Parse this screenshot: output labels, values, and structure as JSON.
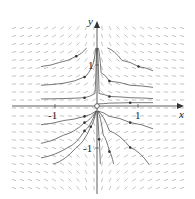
{
  "chart_data": {
    "type": "line",
    "title": "",
    "subtitle": "Direction field with solution curves (phase portrait)",
    "xlabel": "x",
    "ylabel": "y",
    "x_ticks": [
      -1,
      1
    ],
    "y_ticks": [
      1,
      -1
    ],
    "xlim": [
      -1.4,
      1.4
    ],
    "ylim": [
      -1.4,
      1.4
    ],
    "grid": false,
    "legend": "none",
    "origin_marker": "open circle",
    "series": [
      {
        "name": "upper-left-1",
        "points": [
          [
            -1.35,
            0.95
          ],
          [
            -0.9,
            1.05
          ],
          [
            -0.5,
            1.2
          ],
          [
            -0.25,
            1.4
          ]
        ]
      },
      {
        "name": "upper-left-2",
        "points": [
          [
            -1.35,
            0.5
          ],
          [
            -0.8,
            0.55
          ],
          [
            -0.3,
            0.7
          ],
          [
            -0.1,
            1.0
          ],
          [
            -0.03,
            1.4
          ]
        ]
      },
      {
        "name": "upper-left-3",
        "points": [
          [
            -1.35,
            0.17
          ],
          [
            -0.8,
            0.18
          ],
          [
            -0.3,
            0.2
          ],
          [
            -0.05,
            0.3
          ],
          [
            -0.01,
            1.4
          ]
        ]
      },
      {
        "name": "upper-right-1",
        "points": [
          [
            0.25,
            1.4
          ],
          [
            0.6,
            1.1
          ],
          [
            1.0,
            0.95
          ],
          [
            1.35,
            0.85
          ]
        ]
      },
      {
        "name": "upper-right-2",
        "points": [
          [
            0.03,
            1.4
          ],
          [
            0.1,
            0.8
          ],
          [
            0.3,
            0.6
          ],
          [
            0.8,
            0.5
          ],
          [
            1.35,
            0.45
          ]
        ]
      },
      {
        "name": "upper-right-3",
        "points": [
          [
            0.01,
            1.4
          ],
          [
            0.05,
            0.3
          ],
          [
            0.3,
            0.23
          ],
          [
            0.8,
            0.2
          ],
          [
            1.35,
            0.18
          ]
        ]
      },
      {
        "name": "upper-right-4",
        "points": [
          [
            0.02,
            0.05
          ],
          [
            0.3,
            0.07
          ],
          [
            0.8,
            0.08
          ],
          [
            1.35,
            0.08
          ]
        ]
      },
      {
        "name": "lower-left-1",
        "points": [
          [
            -1.35,
            -0.45
          ],
          [
            -0.8,
            -0.35
          ],
          [
            -0.3,
            -0.25
          ],
          [
            -0.02,
            -0.12
          ]
        ]
      },
      {
        "name": "lower-left-2",
        "points": [
          [
            -1.35,
            -0.9
          ],
          [
            -0.8,
            -0.7
          ],
          [
            -0.3,
            -0.4
          ],
          [
            -0.02,
            -0.12
          ]
        ]
      },
      {
        "name": "lower-left-3",
        "points": [
          [
            -1.35,
            -1.25
          ],
          [
            -0.7,
            -1.0
          ],
          [
            -0.3,
            -0.6
          ],
          [
            -0.02,
            -0.12
          ]
        ]
      },
      {
        "name": "lower-left-4",
        "points": [
          [
            -1.05,
            -1.4
          ],
          [
            -0.5,
            -1.0
          ],
          [
            -0.15,
            -0.5
          ],
          [
            -0.02,
            -0.12
          ]
        ]
      },
      {
        "name": "lower-right-1",
        "points": [
          [
            0.02,
            -0.12
          ],
          [
            0.3,
            -0.25
          ],
          [
            0.8,
            -0.4
          ],
          [
            1.35,
            -0.55
          ]
        ]
      },
      {
        "name": "lower-right-2",
        "points": [
          [
            0.02,
            -0.12
          ],
          [
            0.3,
            -0.6
          ],
          [
            0.8,
            -1.0
          ],
          [
            1.25,
            -1.4
          ]
        ]
      },
      {
        "name": "lower-right-3",
        "points": [
          [
            0.02,
            -0.12
          ],
          [
            0.15,
            -0.7
          ],
          [
            0.3,
            -1.1
          ],
          [
            0.4,
            -1.4
          ]
        ]
      },
      {
        "name": "lower-mid",
        "points": [
          [
            0.0,
            -0.12
          ],
          [
            0.05,
            -0.8
          ],
          [
            0.08,
            -1.4
          ]
        ]
      }
    ]
  },
  "labels": {
    "x": "x",
    "y": "y",
    "xtick_neg": "-1",
    "xtick_pos": "1",
    "ytick_pos": "1",
    "ytick_neg": "-1"
  }
}
